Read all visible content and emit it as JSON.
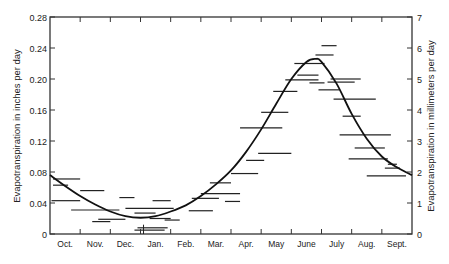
{
  "chart_data": {
    "type": "line",
    "title": "",
    "xlabel": "",
    "ylabel": "Evapotranspiration in inches per day",
    "ylabel_right": "Evapotranspiration in millimeters per day",
    "categories": [
      "Oct.",
      "Nov.",
      "Dec.",
      "Jan.",
      "Feb.",
      "Mar.",
      "Apr.",
      "May",
      "June",
      "July",
      "Aug.",
      "Sept."
    ],
    "ylim": [
      0,
      0.28
    ],
    "ylim_right": [
      0,
      7
    ],
    "yticks": [
      "0",
      "0.04",
      "0.08",
      "0.12",
      "0.16",
      "0.20",
      "0.24",
      "0.28"
    ],
    "yticks_right": [
      "0",
      "1",
      "2",
      "3",
      "4",
      "5",
      "6",
      "7"
    ],
    "grid": false,
    "series": [
      {
        "name": "Smoothed evapotranspiration curve",
        "kind": "curve",
        "x": [
          0.0,
          0.5,
          1.0,
          1.5,
          2.0,
          2.5,
          3.0,
          3.5,
          4.0,
          4.5,
          5.0,
          5.5,
          6.0,
          6.5,
          7.0,
          7.5,
          8.0,
          8.5,
          8.8,
          9.0,
          9.5,
          10.0,
          10.5,
          11.0,
          11.5,
          12.0
        ],
        "values": [
          0.076,
          0.062,
          0.049,
          0.038,
          0.029,
          0.023,
          0.021,
          0.023,
          0.029,
          0.037,
          0.049,
          0.064,
          0.082,
          0.106,
          0.135,
          0.168,
          0.2,
          0.222,
          0.226,
          0.222,
          0.194,
          0.155,
          0.123,
          0.1,
          0.086,
          0.076
        ]
      },
      {
        "name": "Measured period averages",
        "kind": "horizontal-segments",
        "segments": [
          {
            "x0": 0.1,
            "x1": 1.0,
            "y": 0.071
          },
          {
            "x0": 0.1,
            "x1": 0.6,
            "y": 0.063
          },
          {
            "x0": 0.05,
            "x1": 1.0,
            "y": 0.043
          },
          {
            "x0": 1.0,
            "x1": 1.8,
            "y": 0.056
          },
          {
            "x0": 0.7,
            "x1": 2.3,
            "y": 0.031
          },
          {
            "x0": 1.4,
            "x1": 2.0,
            "y": 0.016
          },
          {
            "x0": 1.6,
            "x1": 2.5,
            "y": 0.019
          },
          {
            "x0": 2.3,
            "x1": 2.8,
            "y": 0.047
          },
          {
            "x0": 2.5,
            "x1": 4.1,
            "y": 0.033
          },
          {
            "x0": 2.8,
            "x1": 3.5,
            "y": 0.027
          },
          {
            "x0": 3.4,
            "x1": 4.0,
            "y": 0.043
          },
          {
            "x0": 3.3,
            "x1": 4.0,
            "y": 0.02
          },
          {
            "x0": 2.9,
            "x1": 3.9,
            "y": 0.008
          },
          {
            "x0": 2.8,
            "x1": 3.8,
            "y": 0.005
          },
          {
            "x0": 3.8,
            "x1": 4.3,
            "y": 0.018
          },
          {
            "x0": 4.6,
            "x1": 5.4,
            "y": 0.03
          },
          {
            "x0": 4.7,
            "x1": 5.6,
            "y": 0.046
          },
          {
            "x0": 5.0,
            "x1": 6.3,
            "y": 0.052
          },
          {
            "x0": 5.8,
            "x1": 6.3,
            "y": 0.042
          },
          {
            "x0": 5.3,
            "x1": 6.0,
            "y": 0.066
          },
          {
            "x0": 6.0,
            "x1": 6.9,
            "y": 0.078
          },
          {
            "x0": 6.5,
            "x1": 7.1,
            "y": 0.095
          },
          {
            "x0": 6.9,
            "x1": 8.0,
            "y": 0.104
          },
          {
            "x0": 6.3,
            "x1": 7.7,
            "y": 0.137
          },
          {
            "x0": 7.0,
            "x1": 7.9,
            "y": 0.157
          },
          {
            "x0": 7.4,
            "x1": 8.2,
            "y": 0.184
          },
          {
            "x0": 7.8,
            "x1": 8.9,
            "y": 0.199
          },
          {
            "x0": 8.2,
            "x1": 8.9,
            "y": 0.205
          },
          {
            "x0": 8.1,
            "x1": 9.1,
            "y": 0.22
          },
          {
            "x0": 8.8,
            "x1": 9.4,
            "y": 0.231
          },
          {
            "x0": 9.0,
            "x1": 9.5,
            "y": 0.243
          },
          {
            "x0": 8.6,
            "x1": 9.1,
            "y": 0.195
          },
          {
            "x0": 8.9,
            "x1": 9.6,
            "y": 0.186
          },
          {
            "x0": 9.3,
            "x1": 10.3,
            "y": 0.2
          },
          {
            "x0": 9.2,
            "x1": 10.1,
            "y": 0.196
          },
          {
            "x0": 9.4,
            "x1": 10.8,
            "y": 0.174
          },
          {
            "x0": 9.7,
            "x1": 10.3,
            "y": 0.152
          },
          {
            "x0": 9.6,
            "x1": 11.3,
            "y": 0.128
          },
          {
            "x0": 10.1,
            "x1": 11.1,
            "y": 0.111
          },
          {
            "x0": 9.9,
            "x1": 11.2,
            "y": 0.097
          },
          {
            "x0": 11.2,
            "x1": 11.5,
            "y": 0.09
          },
          {
            "x0": 11.1,
            "x1": 11.6,
            "y": 0.085
          },
          {
            "x0": 10.5,
            "x1": 11.8,
            "y": 0.075
          }
        ]
      }
    ],
    "colors": {
      "line": "#111111",
      "axis": "#333333",
      "text": "#222222",
      "background": "#ffffff"
    }
  }
}
